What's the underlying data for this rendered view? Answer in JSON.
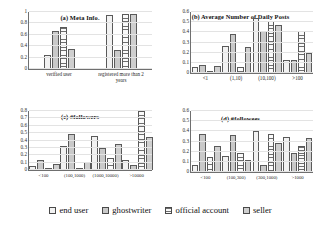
{
  "legend": {
    "position": "bottom",
    "items": [
      {
        "label": "end user",
        "series": 0
      },
      {
        "label": "ghostwriter",
        "series": 1
      },
      {
        "label": "official account",
        "series": 2
      },
      {
        "label": "seller",
        "series": 3
      }
    ]
  },
  "chart_data": [
    {
      "id": "a",
      "type": "bar",
      "title": "(a) Meta Info.",
      "xlabel": "",
      "ylabel": "",
      "ylim": [
        0,
        1
      ],
      "yticks": [
        0,
        0.2,
        0.4,
        0.6,
        0.8,
        1
      ],
      "grid": true,
      "categories": [
        "verified user",
        "registered more than 2\nyears"
      ],
      "series": [
        {
          "name": "end user",
          "values": [
            0.25,
            0.95
          ]
        },
        {
          "name": "ghostwriter",
          "values": [
            0.66,
            0.33
          ]
        },
        {
          "name": "official account",
          "values": [
            0.73,
            0.97
          ]
        },
        {
          "name": "seller",
          "values": [
            0.35,
            0.96
          ]
        }
      ]
    },
    {
      "id": "b",
      "type": "bar",
      "title": "(b) Average Number of Daily Posts",
      "xlabel": "",
      "ylabel": "",
      "ylim": [
        0,
        0.6
      ],
      "yticks": [
        0,
        0.1,
        0.2,
        0.3,
        0.4,
        0.5,
        0.6
      ],
      "grid": true,
      "categories": [
        "<1",
        "(1,10)",
        "(10,100)",
        ">100"
      ],
      "series": [
        {
          "name": "end user",
          "values": [
            0.06,
            0.27,
            0.54,
            0.13
          ]
        },
        {
          "name": "ghostwriter",
          "values": [
            0.08,
            0.38,
            0.41,
            0.13
          ]
        },
        {
          "name": "official account",
          "values": [
            0.01,
            0.06,
            0.51,
            0.41
          ]
        },
        {
          "name": "seller",
          "values": [
            0.07,
            0.26,
            0.47,
            0.2
          ]
        }
      ]
    },
    {
      "id": "c",
      "type": "bar",
      "title": "(c) #followers",
      "xlabel": "",
      "ylabel": "",
      "ylim": [
        0,
        0.8
      ],
      "yticks": [
        0,
        0.1,
        0.2,
        0.3,
        0.4,
        0.5,
        0.6,
        0.7,
        0.8
      ],
      "grid": true,
      "categories": [
        "<100",
        "(100,1000)",
        "(1000,10000)",
        ">10000"
      ],
      "series": [
        {
          "name": "end user",
          "values": [
            0.06,
            0.32,
            0.46,
            0.14
          ]
        },
        {
          "name": "ghostwriter",
          "values": [
            0.13,
            0.49,
            0.3,
            0.07
          ]
        },
        {
          "name": "official account",
          "values": [
            0.0,
            0.02,
            0.16,
            0.8
          ]
        },
        {
          "name": "seller",
          "values": [
            0.08,
            0.11,
            0.35,
            0.45
          ]
        }
      ]
    },
    {
      "id": "d",
      "type": "bar",
      "title": "(d) #followees",
      "xlabel": "",
      "ylabel": "",
      "ylim": [
        0,
        0.6
      ],
      "yticks": [
        0,
        0.1,
        0.2,
        0.3,
        0.4,
        0.5,
        0.6
      ],
      "grid": true,
      "categories": [
        "<100",
        "(100,300)",
        "(300,1000)",
        ">1000"
      ],
      "series": [
        {
          "name": "end user",
          "values": [
            0.07,
            0.16,
            0.4,
            0.34
          ]
        },
        {
          "name": "ghostwriter",
          "values": [
            0.37,
            0.36,
            0.07,
            0.19
          ]
        },
        {
          "name": "official account",
          "values": [
            0.15,
            0.19,
            0.37,
            0.26
          ]
        },
        {
          "name": "seller",
          "values": [
            0.26,
            0.12,
            0.29,
            0.33
          ]
        }
      ]
    }
  ]
}
